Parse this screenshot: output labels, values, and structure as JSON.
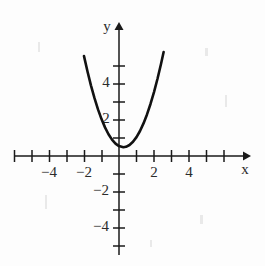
{
  "chart_data": {
    "type": "line",
    "title": "",
    "subtitle": "",
    "xlabel": "x",
    "ylabel": "y",
    "xlim": [
      -6.0,
      7.0
    ],
    "ylim": [
      -6.2,
      6.5
    ],
    "grid": false,
    "legend": null,
    "x_ticks": [
      -6,
      -5,
      -4,
      -3,
      -2,
      -1,
      1,
      2,
      3,
      4,
      5,
      6,
      7
    ],
    "y_ticks": [
      -5,
      -4,
      -3,
      -2,
      -1,
      1,
      2,
      3,
      4,
      5
    ],
    "x_tick_labels": [
      {
        "value": -4,
        "text": "−4"
      },
      {
        "value": -2,
        "text": "−2"
      },
      {
        "value": 2,
        "text": "2"
      },
      {
        "value": 4,
        "text": "4"
      }
    ],
    "y_tick_labels": [
      {
        "value": 4,
        "text": "4"
      },
      {
        "value": 2,
        "text": "2"
      },
      {
        "value": -2,
        "text": "−2"
      },
      {
        "value": -4,
        "text": "−4"
      }
    ],
    "series": [
      {
        "name": "parabola",
        "kind": "quadratic",
        "equation": "y = x^2 - 0.5x + 0.55",
        "color": "#111111",
        "vertex": [
          0.25,
          0.49
        ],
        "x_domain": [
          -2.0,
          2.55
        ],
        "x": [
          -2.0,
          -1.8,
          -1.6,
          -1.4,
          -1.2,
          -1.0,
          -0.8,
          -0.6,
          -0.4,
          -0.2,
          0.0,
          0.25,
          0.4,
          0.6,
          0.8,
          1.0,
          1.2,
          1.4,
          1.6,
          1.8,
          2.0,
          2.2,
          2.4,
          2.55
        ],
        "values": [
          5.55,
          4.69,
          3.91,
          3.21,
          2.59,
          2.05,
          1.59,
          1.21,
          0.91,
          0.69,
          0.55,
          0.49,
          0.51,
          0.61,
          0.79,
          1.05,
          1.39,
          1.81,
          2.31,
          2.89,
          3.55,
          4.29,
          5.11,
          5.78
        ]
      }
    ],
    "axes": {
      "x_axis_label": "x",
      "y_axis_label": "y",
      "origin": [
        0,
        0
      ],
      "arrowheads": [
        "x-positive",
        "y-positive"
      ]
    }
  },
  "figure": {
    "background_color": "#fdfdfd",
    "axis_color": "#1a1a1a",
    "curve_color": "#111111",
    "label_color": "#2b2b2b"
  }
}
